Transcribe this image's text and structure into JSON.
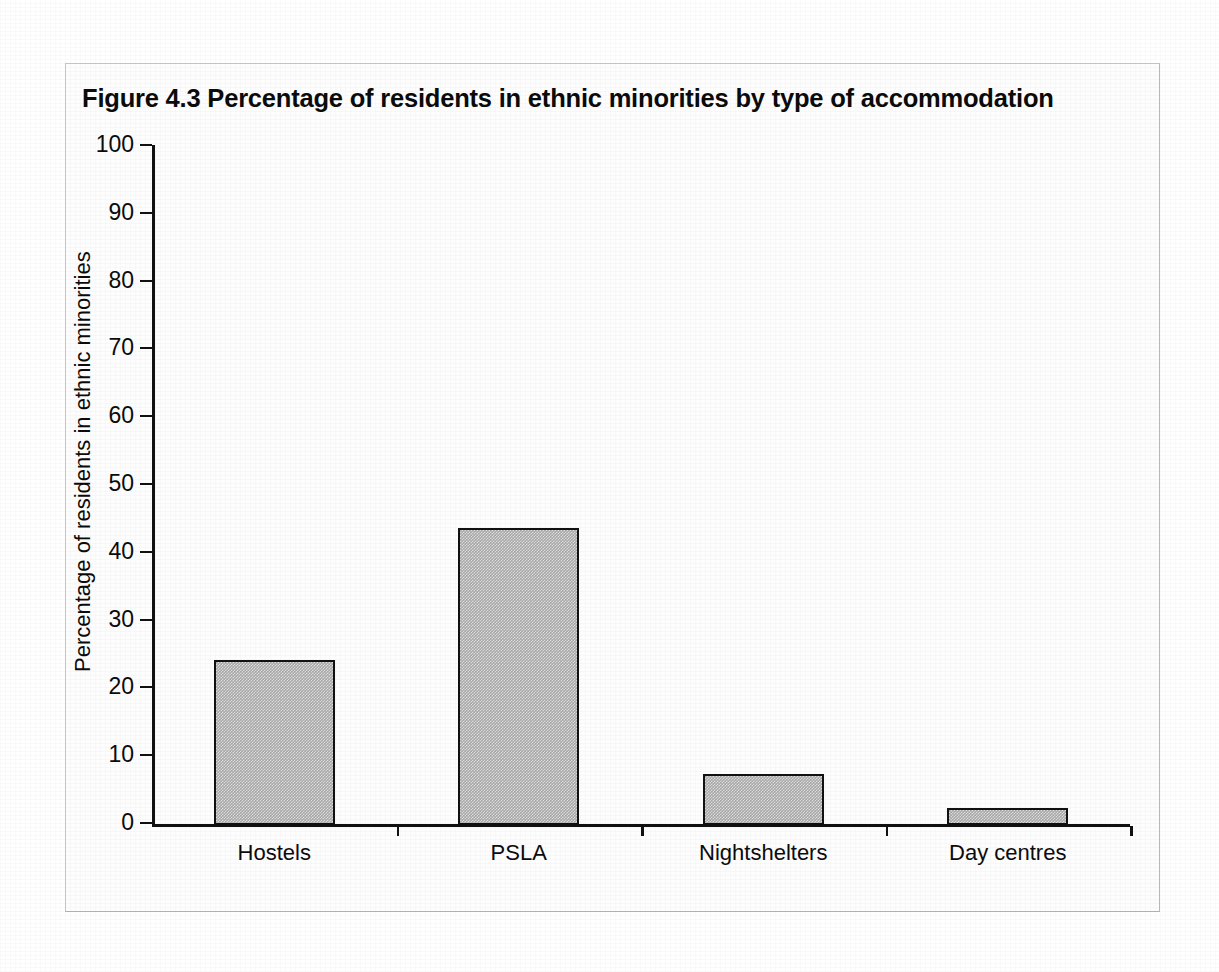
{
  "figure": {
    "title": "Figure 4.3  Percentage of residents in ethnic minorities by type of accommodation",
    "frame_color": "#c9c9c9",
    "background_color": "#ffffff"
  },
  "chart_data": {
    "type": "bar",
    "title": "Figure 4.3  Percentage of residents in ethnic minorities by type of accommodation",
    "categories": [
      "Hostels",
      "PSLA",
      "Nightshelters",
      "Day centres"
    ],
    "values": [
      24,
      43.5,
      7.2,
      2.2
    ],
    "xlabel": "",
    "ylabel": "Percentage of residents in ethnic minorities",
    "ylim": [
      0,
      100
    ],
    "ytick_labels": [
      "0",
      "10",
      "20",
      "30",
      "40",
      "50",
      "60",
      "70",
      "80",
      "90",
      "100"
    ],
    "ytick_values": [
      0,
      10,
      20,
      30,
      40,
      50,
      60,
      70,
      80,
      90,
      100
    ],
    "grid": false,
    "legend": null,
    "bar_fill_color": "#a9a9a9",
    "bar_edge_color": "#111111",
    "axis_color": "#111111"
  }
}
